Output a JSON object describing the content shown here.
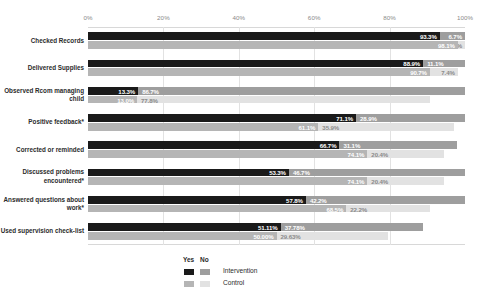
{
  "chart_data": {
    "type": "bar",
    "orientation": "horizontal",
    "stacked": true,
    "title": "",
    "xlabel": "",
    "ylabel": "",
    "xlim": [
      0,
      100
    ],
    "xticks": [
      "0%",
      "20%",
      "40%",
      "60%",
      "80%",
      "100%"
    ],
    "xtick_values": [
      0,
      20,
      40,
      60,
      80,
      100
    ],
    "grid": true,
    "legend_position": "bottom-center",
    "legend": {
      "header_yes": "Yes",
      "header_no": "No",
      "rows": [
        {
          "name": "Intervention",
          "yes_color": "#1a1a1a",
          "no_color": "#9e9e9e"
        },
        {
          "name": "Control",
          "yes_color": "#b5b5b5",
          "no_color": "#e2e2e2"
        }
      ]
    },
    "colors": {
      "intervention_yes": "#1a1a1a",
      "intervention_no": "#9e9e9e",
      "control_yes": "#b5b5b5",
      "control_no": "#e2e2e2",
      "grid": "#e2e2e2",
      "tick_text": "#8a8a8a",
      "category_text": "#2b2b2b"
    },
    "categories": [
      "Checked Records",
      "Delivered Supplies",
      "Observed Rcom managing child",
      "Positive feedback*",
      "Corrected or reminded",
      "Discussed problems encountered*",
      "Answered questions about work*",
      "Used supervision check-list"
    ],
    "series": [
      {
        "name": "Intervention",
        "yes_values": [
          93.3,
          88.9,
          13.3,
          71.1,
          66.7,
          53.3,
          57.8,
          51.11
        ],
        "no_values": [
          6.7,
          11.1,
          86.7,
          28.9,
          31.1,
          46.7,
          42.2,
          37.78
        ],
        "yes_labels": [
          "93.3%",
          "88.9%",
          "13.3%",
          "71.1%",
          "66.7%",
          "53.3%",
          "57.8%",
          "51.11%"
        ],
        "no_labels": [
          "6.7%",
          "11.1%",
          "86.7%",
          "28.9%",
          "31.1%",
          "46.7%",
          "42.2%",
          "37.78%"
        ]
      },
      {
        "name": "Control",
        "yes_values": [
          98.1,
          90.7,
          13.0,
          61.1,
          74.1,
          74.1,
          68.5,
          50.0
        ],
        "no_values": [
          1.9,
          7.4,
          77.8,
          35.9,
          20.4,
          20.4,
          22.2,
          29.63
        ],
        "yes_labels": [
          "98.1%",
          "90.7%",
          "13.0%",
          "61.1%",
          "74.1%",
          "74.1%",
          "68.5%",
          "50.00%"
        ],
        "no_labels": [
          "1.9%",
          "7.4%",
          "77.8%",
          "35.9%",
          "20.4%",
          "20.4%",
          "22.2%",
          "29.63%"
        ]
      }
    ]
  }
}
